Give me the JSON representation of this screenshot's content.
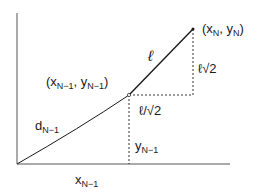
{
  "diagram": {
    "labels": {
      "point_end": "(x",
      "point_end_sub1": "N",
      "point_end_mid": ", y",
      "point_end_sub2": "N",
      "point_end_close": ")",
      "point_mid": "(x",
      "point_mid_sub1": "N−1",
      "point_mid_mid": ", y",
      "point_mid_sub2": "N−1",
      "point_mid_close": ")",
      "segment": "ℓ",
      "vertical_leg": "ℓ√2",
      "horizontal_leg": "ℓ/√2",
      "distance": "d",
      "distance_sub": "N−1",
      "y_proj": "y",
      "y_proj_sub": "N−1",
      "x_proj": "x",
      "x_proj_sub": "N−1"
    },
    "colors": {
      "line": "#1a1a1a",
      "background": "#ffffff"
    }
  }
}
